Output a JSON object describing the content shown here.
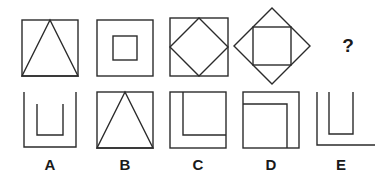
{
  "puzzle": {
    "type": "visual-analogy-matrix",
    "background_color": "#ffffff",
    "ink_color": "#2b2b2b",
    "question_marker": "?",
    "prompt_row": {
      "name": "problem-row",
      "items": [
        {
          "id": "problem-1",
          "description": "square with inscribed triangle apex at top center",
          "shapes": [
            "square",
            "triangle"
          ]
        },
        {
          "id": "problem-2",
          "description": "square with smaller concentric square inside",
          "shapes": [
            "square",
            "square"
          ]
        },
        {
          "id": "problem-3",
          "description": "square with inscribed diamond touching side midpoints",
          "shapes": [
            "square",
            "diamond"
          ]
        },
        {
          "id": "problem-4",
          "description": "diamond with inscribed upright square",
          "shapes": [
            "diamond",
            "square"
          ]
        },
        {
          "id": "problem-5",
          "description": "unknown missing figure",
          "shapes": []
        }
      ]
    },
    "answer_row": {
      "name": "answer-options-row",
      "options": [
        {
          "id": "option-a",
          "label": "A",
          "description": "large U bracket with smaller U bracket nested inside"
        },
        {
          "id": "option-b",
          "label": "B",
          "description": "square with inscribed triangle apex at top center"
        },
        {
          "id": "option-c",
          "label": "C",
          "description": "square with inner L bracket open to the top right"
        },
        {
          "id": "option-d",
          "label": "D",
          "description": "square with inner corner bracket open to the bottom left"
        },
        {
          "id": "option-e",
          "label": "E",
          "description": "U bracket nested with extended baseline to the right"
        }
      ]
    }
  }
}
